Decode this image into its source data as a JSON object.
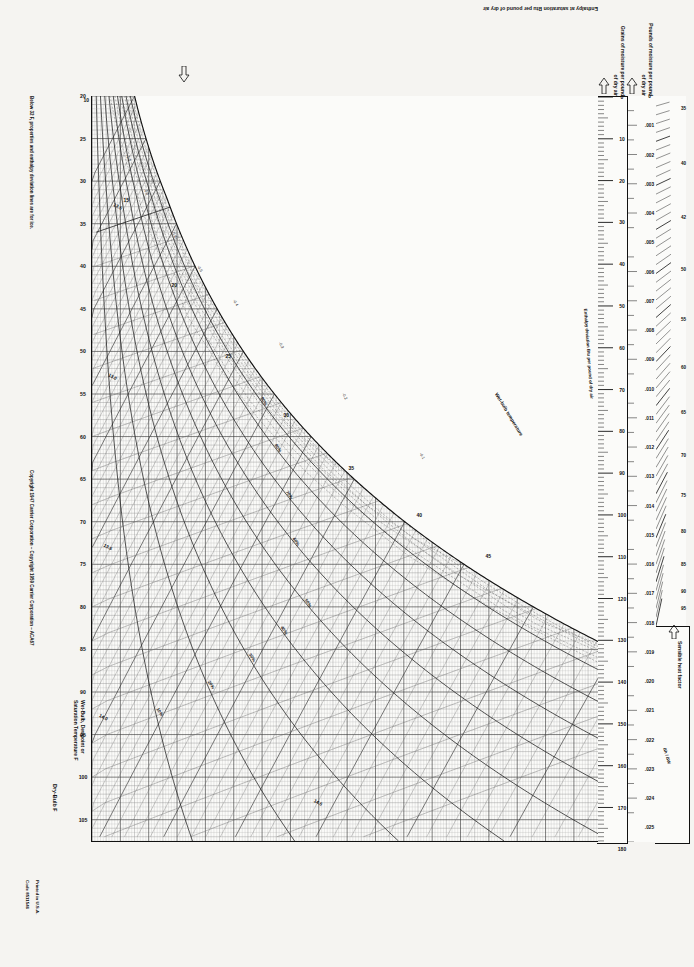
{
  "document": {
    "kind": "psychrometric-chart",
    "chart_title": "Carrier Psychrometric Chart",
    "normal_temperatures_note": "Normal Temperatures",
    "barometric_note": "Barometric Pressure 29.92 in. Hg"
  },
  "axes": {
    "dry_bulb": {
      "label": "Dry-Bulb F",
      "min": 20,
      "max": 105,
      "ticks": [
        20,
        25,
        30,
        35,
        40,
        45,
        50,
        55,
        60,
        65,
        70,
        75,
        80,
        85,
        90,
        95,
        100,
        105
      ]
    },
    "wet_bulb": {
      "label": "Wet-Bulb, Dewpoint or Saturation Temperature F",
      "ticks": [
        20,
        25,
        30,
        35,
        40,
        45,
        50,
        55,
        60,
        65,
        70,
        75,
        80,
        85,
        90
      ]
    },
    "enthalpy_saturation": {
      "label": "Enthalpy at saturation  Btu per pound of dry air",
      "ticks": [
        10,
        15,
        20,
        25,
        30,
        35,
        40,
        45,
        50,
        55,
        60,
        65,
        70,
        75,
        80,
        85,
        90,
        95,
        100,
        105
      ]
    },
    "grains": {
      "label": "Grains of moisture per pound of dry air",
      "min": 0,
      "max": 180,
      "ticks": [
        0,
        10,
        20,
        30,
        40,
        50,
        60,
        70,
        80,
        90,
        100,
        110,
        120,
        130,
        140,
        150,
        160,
        170,
        180
      ]
    },
    "pounds": {
      "label": "Pounds of moisture per pound of dry air",
      "min": 0,
      "max": 0.0255,
      "ticks": [
        "0",
        ".001",
        ".002",
        ".003",
        ".004",
        ".005",
        ".006",
        ".007",
        ".008",
        ".009",
        ".010",
        ".011",
        ".012",
        ".013",
        ".014",
        ".015",
        ".016",
        ".017",
        ".018",
        ".019",
        ".020",
        ".021",
        ".022",
        ".023",
        ".024",
        ".025"
      ]
    }
  },
  "protractor": {
    "title": "Sensible heat factor",
    "enthalpy_ratio_label": "Δh / ΔW",
    "shf_ticks": [
      "1.0",
      ".95",
      ".9",
      ".85",
      ".8",
      ".75",
      ".7",
      ".65",
      ".6",
      ".55",
      ".5",
      ".45",
      ".4",
      ".35",
      ".3",
      ".2",
      ".1",
      "0"
    ],
    "labels": [
      "35",
      "40",
      "42",
      "50",
      "55",
      "60",
      "65",
      "70",
      "75",
      "80",
      "85",
      "90",
      "95"
    ]
  },
  "curves": {
    "relative_humidity": {
      "label": "Relative Humidity",
      "values": [
        "10%",
        "20%",
        "30%",
        "40%",
        "50%",
        "60%",
        "70%",
        "80%",
        "90%"
      ]
    },
    "specific_volume": {
      "label": "cu ft per pound of dry air",
      "values": [
        "12.5",
        "13.0",
        "13.5",
        "14.0",
        "14.5"
      ]
    },
    "enthalpy_deviation": {
      "label": "Enthalpy deviation Btu per pound of dry air",
      "values": [
        "-0.1",
        "-0.2",
        "-0.3",
        "-0.4",
        "-0.5",
        "-0.6",
        "-0.8",
        "-1.0",
        "0.1",
        "0.2",
        "0.3"
      ]
    },
    "wet_bulb_label": "Wet-bulb temperature"
  },
  "footnotes": {
    "below32": "Below 32 F, properties and enthalpy deviation lines are for ice.",
    "copyright": "Copyright 1947 Carrier Corporation – Copyright 1959 Carrier Corporation – ACA67",
    "printed": "Printed in U.S.A.",
    "code": "Code 8511546"
  },
  "colors": {
    "ink": "#111111",
    "grid_light": "#9a9a9a",
    "grid_mid": "#6e6e6e",
    "paper": "#f5f4f1"
  }
}
